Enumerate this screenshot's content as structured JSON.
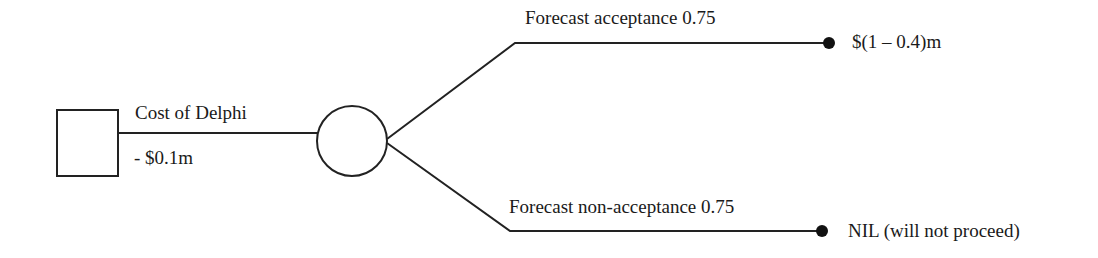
{
  "diagram": {
    "type": "decision-tree",
    "colors": {
      "line": "#222222",
      "background": "#ffffff",
      "text": "#1a1a1a"
    },
    "decision_node": {
      "shape": "square"
    },
    "root_branch": {
      "label": "Cost of Delphi",
      "value": "- $0.1m"
    },
    "chance_node": {
      "shape": "circle"
    },
    "outcomes": [
      {
        "label": "Forecast acceptance 0.75",
        "payoff": "$(1 – 0.4)m"
      },
      {
        "label": "Forecast non-acceptance 0.75",
        "payoff": "NIL (will not proceed)"
      }
    ]
  }
}
